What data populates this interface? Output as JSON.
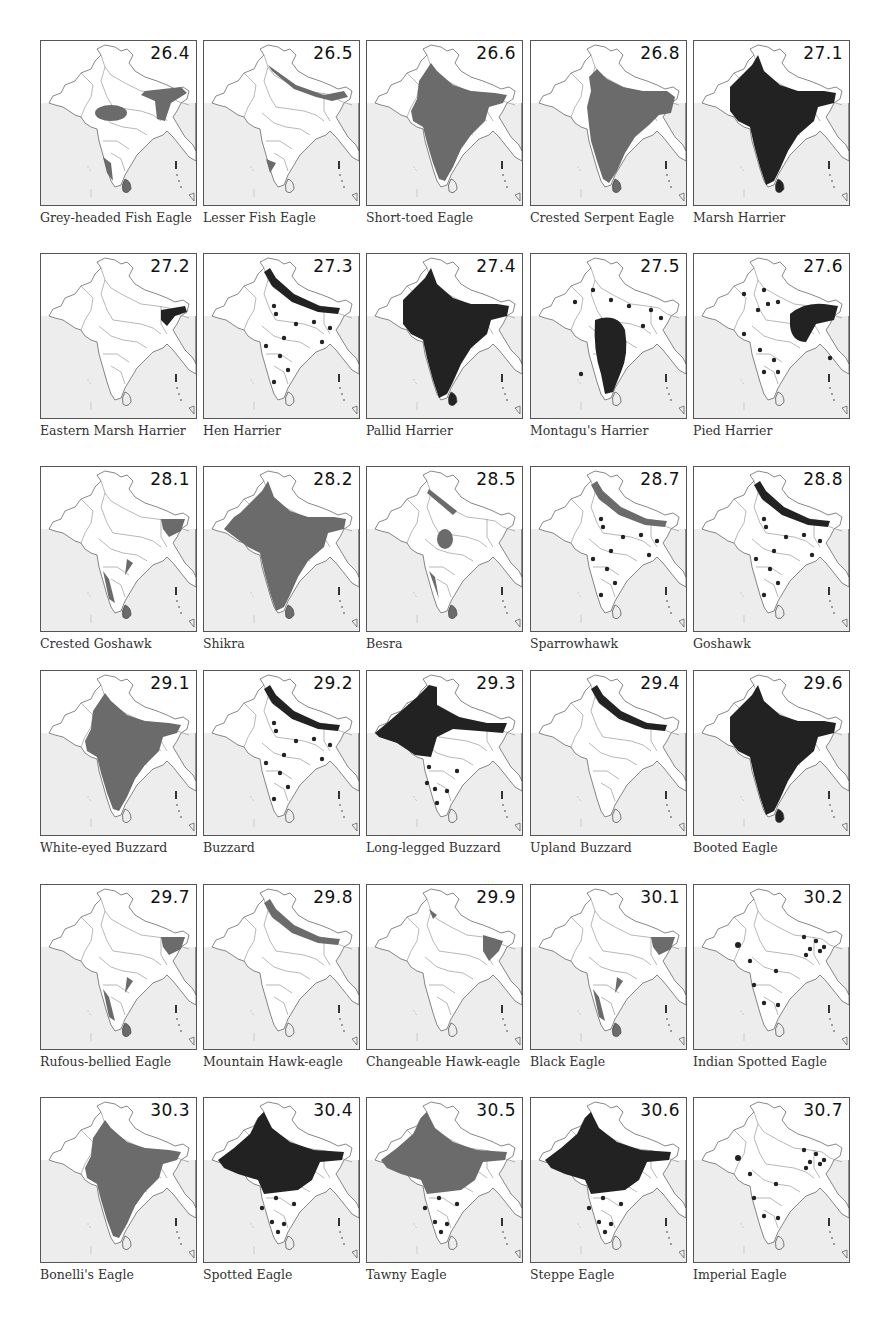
{
  "page": {
    "type": "field-guide range map plate",
    "colors": {
      "resident": "#222222",
      "winter_or_secondary": "#6b6b6b",
      "sea": "#ededed",
      "land": "#ffffff",
      "border": "#666666"
    }
  },
  "maps": [
    {
      "number": "26.4",
      "name": "Grey-headed Fish Eagle",
      "style": "grey",
      "shape": "fish1"
    },
    {
      "number": "26.5",
      "name": "Lesser Fish Eagle",
      "style": "grey",
      "shape": "fish2"
    },
    {
      "number": "26.6",
      "name": "Short-toed Eagle",
      "style": "grey",
      "shape": "mainland"
    },
    {
      "number": "26.8",
      "name": "Crested Serpent Eagle",
      "style": "grey",
      "shape": "mainland_ne"
    },
    {
      "number": "27.1",
      "name": "Marsh Harrier",
      "style": "black",
      "shape": "whole"
    },
    {
      "number": "27.2",
      "name": "Eastern Marsh Harrier",
      "style": "black",
      "shape": "ne_only"
    },
    {
      "number": "27.3",
      "name": "Hen Harrier",
      "style": "black",
      "shape": "himalaya_dots"
    },
    {
      "number": "27.4",
      "name": "Pallid Harrier",
      "style": "black",
      "shape": "whole"
    },
    {
      "number": "27.5",
      "name": "Montagu's Harrier",
      "style": "black",
      "shape": "peninsula_dots"
    },
    {
      "number": "27.6",
      "name": "Pied Harrier",
      "style": "black",
      "shape": "east_blob"
    },
    {
      "number": "28.1",
      "name": "Crested Goshawk",
      "style": "grey",
      "shape": "ghats_ne"
    },
    {
      "number": "28.2",
      "name": "Shikra",
      "style": "grey",
      "shape": "whole_grey"
    },
    {
      "number": "28.5",
      "name": "Besra",
      "style": "grey",
      "shape": "besra"
    },
    {
      "number": "28.7",
      "name": "Sparrowhawk",
      "style": "grey",
      "shape": "himalaya_dots"
    },
    {
      "number": "28.8",
      "name": "Goshawk",
      "style": "black",
      "shape": "himalaya_dots"
    },
    {
      "number": "29.1",
      "name": "White-eyed Buzzard",
      "style": "grey",
      "shape": "mainland"
    },
    {
      "number": "29.2",
      "name": "Buzzard",
      "style": "black",
      "shape": "himalaya_dots"
    },
    {
      "number": "29.3",
      "name": "Long-legged Buzzard",
      "style": "black",
      "shape": "northwest"
    },
    {
      "number": "29.4",
      "name": "Upland Buzzard",
      "style": "black",
      "shape": "himalaya"
    },
    {
      "number": "29.6",
      "name": "Booted Eagle",
      "style": "black",
      "shape": "whole"
    },
    {
      "number": "29.7",
      "name": "Rufous-bellied Eagle",
      "style": "grey",
      "shape": "ghats_ne"
    },
    {
      "number": "29.8",
      "name": "Mountain Hawk-eagle",
      "style": "grey",
      "shape": "himalaya"
    },
    {
      "number": "29.9",
      "name": "Changeable Hawk-eagle",
      "style": "grey",
      "shape": "changeable"
    },
    {
      "number": "30.1",
      "name": "Black Eagle",
      "style": "grey",
      "shape": "ghats_ne"
    },
    {
      "number": "30.2",
      "name": "Indian Spotted Eagle",
      "style": "black",
      "shape": "sparse_dots"
    },
    {
      "number": "30.3",
      "name": "Bonelli's Eagle",
      "style": "grey",
      "shape": "mainland"
    },
    {
      "number": "30.4",
      "name": "Spotted Eagle",
      "style": "black",
      "shape": "north_plains"
    },
    {
      "number": "30.5",
      "name": "Tawny Eagle",
      "style": "grey",
      "shape": "north_plains"
    },
    {
      "number": "30.6",
      "name": "Steppe Eagle",
      "style": "black",
      "shape": "north_plains"
    },
    {
      "number": "30.7",
      "name": "Imperial Eagle",
      "style": "black",
      "shape": "sparse_dots"
    }
  ],
  "layout": {
    "col_x": [
      40,
      203,
      366,
      530,
      693
    ],
    "row_y": [
      40,
      253,
      466,
      670,
      884,
      1097
    ],
    "caption_offset": 170
  }
}
